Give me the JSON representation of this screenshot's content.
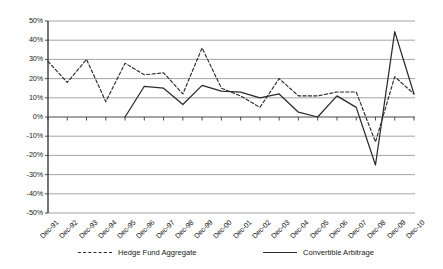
{
  "chart_data": {
    "type": "line",
    "title": "",
    "subtitle": "",
    "xlabel": "",
    "ylabel": "",
    "ylim": [
      -50,
      50
    ],
    "ytick_labels": [
      "50%",
      "40%",
      "30%",
      "20%",
      "10%",
      "0%",
      "-10%",
      "-20%",
      "-30%",
      "-40%",
      "-50%"
    ],
    "ytick_values": [
      50,
      40,
      30,
      20,
      10,
      0,
      -10,
      -20,
      -30,
      -40,
      -50
    ],
    "grid": true,
    "grid_axis": "y",
    "legend_position": "bottom",
    "categories": [
      "Dec-91",
      "Dec-92",
      "Dec-93",
      "Dec-94",
      "Dec-95",
      "Dec-96",
      "Dec-97",
      "Dec-98",
      "Dec-99",
      "Dec-00",
      "Dec-01",
      "Dec-02",
      "Dec-03",
      "Dec-04",
      "Dec-05",
      "Dec-06",
      "Dec-07",
      "Dec-08",
      "Dec-09",
      "Dec-10"
    ],
    "series": [
      {
        "name": "Hedge Fund Aggregate",
        "style": "dashed",
        "color": "#2b2b2b",
        "values": [
          29,
          18,
          30,
          8,
          28,
          22,
          23,
          12,
          36,
          15,
          11,
          5,
          20,
          11,
          11,
          13,
          13,
          -13,
          21,
          12
        ]
      },
      {
        "name": "Convertible Arbitrage",
        "style": "solid",
        "color": "#2b2b2b",
        "values": [
          null,
          null,
          null,
          null,
          0,
          16,
          15,
          6.5,
          16.5,
          13.5,
          13,
          10,
          12,
          2.5,
          0,
          11,
          5,
          -25,
          44.5,
          12
        ]
      }
    ]
  },
  "legend": {
    "items": [
      {
        "label": "Hedge Fund Aggregate",
        "style": "dashed"
      },
      {
        "label": "Convertible Arbitrage",
        "style": "solid"
      }
    ]
  },
  "colors": {
    "axis": "#3a3a3a",
    "grid": "#808080",
    "series": "#2b2b2b",
    "background": "#ffffff"
  }
}
